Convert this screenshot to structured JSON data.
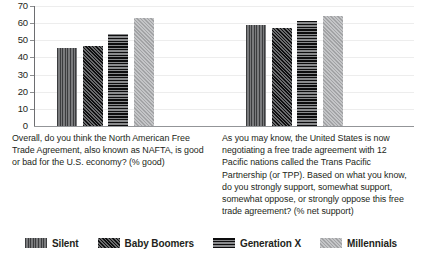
{
  "chart_data": {
    "type": "bar",
    "title": "",
    "xlabel": "",
    "ylabel": "",
    "ylim": [
      0,
      70
    ],
    "ytick_step": 10,
    "yticks": [
      0,
      10,
      20,
      30,
      40,
      50,
      60,
      70
    ],
    "grid": true,
    "legend_position": "bottom",
    "categories": [
      "Overall, do you think the North American Free Trade Agreement, also known as NAFTA, is good or bad for the U.S. economy? (% good)",
      "As you may know, the United States is now negotiating a free trade agreement with 12 Pacific nations called the Trans Pacific Partnership (or TPP). Based on what you know, do you strongly support, somewhat support, somewhat oppose, or strongly oppose this free trade agreement? (% net support)"
    ],
    "series": [
      {
        "name": "Silent",
        "values": [
          45,
          58
        ],
        "pattern": "vertical-stripes",
        "color": "#58595b"
      },
      {
        "name": "Baby Boomers",
        "values": [
          46,
          56
        ],
        "pattern": "diagonal-hatch",
        "color": "#2b2b2d"
      },
      {
        "name": "Generation X",
        "values": [
          53,
          60
        ],
        "pattern": "horizontal-stripes",
        "color": "#313133"
      },
      {
        "name": "Millennials",
        "values": [
          62,
          63
        ],
        "pattern": "light-diagonal",
        "color": "#b3b4b6"
      }
    ]
  },
  "axis": {
    "tick_0": "0",
    "tick_10": "10",
    "tick_20": "20",
    "tick_30": "30",
    "tick_40": "40",
    "tick_50": "50",
    "tick_60": "60",
    "tick_70": "70"
  },
  "captions": {
    "question_1": "Overall, do you think the North American Free Trade Agreement, also known as NAFTA, is good or bad for the U.S. economy? (% good)",
    "question_2": "As you may know, the United States is now negotiating a free trade agreement with 12 Pacific nations called the Trans Pacific Partnership (or TPP). Based on what you know, do you strongly support, somewhat support, somewhat oppose, or strongly oppose this free trade agreement? (% net support)"
  },
  "legend": {
    "items": [
      {
        "label": "Silent"
      },
      {
        "label": "Baby Boomers"
      },
      {
        "label": "Generation X"
      },
      {
        "label": "Millennials"
      }
    ]
  }
}
